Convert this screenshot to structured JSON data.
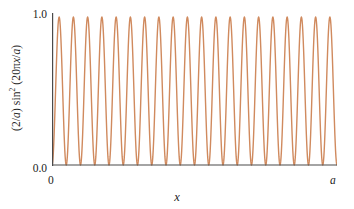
{
  "figure": {
    "background_color": "#ffffff",
    "axis_color": "#4a4a4a"
  },
  "labels": {
    "ylabel_prefix": "(2/",
    "ylabel_a1": "a",
    "ylabel_mid": ") sin",
    "ylabel_exp": "2",
    "ylabel_open": " (20π",
    "ylabel_x": "x",
    "ylabel_slash": "/",
    "ylabel_a2": "a",
    "ylabel_close": ")",
    "ylabel_full": "(2/a) sin² (20πx/a)",
    "xlabel": "x",
    "ytick_top": "1.0",
    "ytick_bottom": "0.0",
    "xtick_left": "0",
    "xtick_right": "a"
  },
  "chart_data": {
    "type": "line",
    "title": "",
    "xlabel": "x",
    "ylabel": "(2/a) sin² (20πx/a)",
    "xlim": [
      0,
      1
    ],
    "ylim": [
      0,
      1
    ],
    "xtick_positions": [
      0,
      1
    ],
    "xtick_labels": [
      "0",
      "a"
    ],
    "ytick_positions": [
      0,
      1
    ],
    "ytick_labels": [
      "0.0",
      "1.0"
    ],
    "grid": false,
    "legend": null,
    "expression": "sin^2(20*pi*x/a)",
    "n_oscillations": 20,
    "period_fraction_of_a": 0.05,
    "peak_value": 1.0,
    "min_value": 0.0,
    "line_color": "#d08a5e",
    "line_width": 1.4,
    "samples_per_period": 40,
    "series": [
      {
        "name": "(2/a) sin² (20πx/a)",
        "peak_x_positions": [
          0.025,
          0.075,
          0.125,
          0.175,
          0.225,
          0.275,
          0.325,
          0.375,
          0.425,
          0.475,
          0.525,
          0.575,
          0.625,
          0.675,
          0.725,
          0.775,
          0.825,
          0.875,
          0.925,
          0.975
        ],
        "peak_values": [
          1,
          1,
          1,
          1,
          1,
          1,
          1,
          1,
          1,
          1,
          1,
          1,
          1,
          1,
          1,
          1,
          1,
          1,
          1,
          1
        ],
        "zero_x_positions": [
          0,
          0.05,
          0.1,
          0.15,
          0.2,
          0.25,
          0.3,
          0.35,
          0.4,
          0.45,
          0.5,
          0.55,
          0.6,
          0.65,
          0.7,
          0.75,
          0.8,
          0.85,
          0.9,
          0.95,
          1.0
        ],
        "zero_values": [
          0,
          0,
          0,
          0,
          0,
          0,
          0,
          0,
          0,
          0,
          0,
          0,
          0,
          0,
          0,
          0,
          0,
          0,
          0,
          0,
          0
        ]
      }
    ]
  }
}
